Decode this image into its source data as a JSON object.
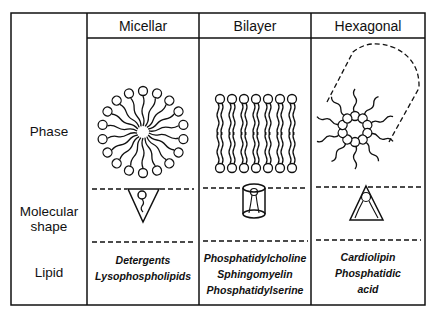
{
  "columns": [
    {
      "title": "Micellar",
      "shape": "inverted-cone",
      "lipids": [
        "Detergents",
        "Lysophospholipids"
      ]
    },
    {
      "title": "Bilayer",
      "shape": "cylinder",
      "lipids": [
        "Phosphatidylcholine",
        "Sphingomyelin",
        "Phosphatidylserine"
      ]
    },
    {
      "title": "Hexagonal",
      "shape": "cone",
      "lipids": [
        "Cardiolipin",
        "Phosphatidic",
        "acid"
      ]
    }
  ],
  "rows": {
    "phase": "Phase",
    "molecular_shape_line1": "Molecular",
    "molecular_shape_line2": "shape",
    "lipid": "Lipid"
  },
  "colors": {
    "line": "#111111",
    "background": "#ffffff"
  }
}
